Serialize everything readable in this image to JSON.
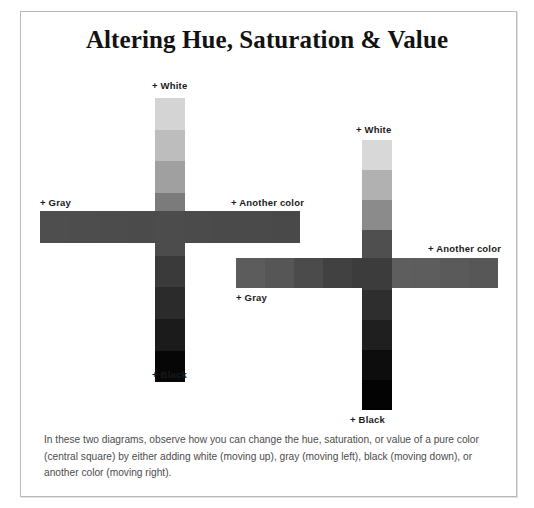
{
  "page": {
    "title": "Altering Hue, Saturation & Value",
    "background_color": "#ffffff",
    "border_color": "#b9b9b9",
    "caption": "In these two diagrams, observe how you can change the hue, saturation, or value of a pure color (central square) by either adding white (moving up), gray (moving left), black (moving down), or another color (moving right)."
  },
  "labels": {
    "white": "+ White",
    "gray": "+ Gray",
    "another_color": "+ Another color",
    "black": "+ Black"
  },
  "chart_data": {
    "type": "heatmap",
    "title": "Altering Hue, Saturation & Value",
    "axis_meanings": {
      "up": "+ White",
      "down": "+ Black",
      "left": "+ Gray",
      "right": "+ Another color"
    },
    "diagrams": [
      {
        "name": "diagram-1",
        "center_color": "#4c4c4c",
        "vertical": {
          "label_top": "+ White",
          "label_bottom": "+ Black",
          "steps_up": [
            "#d4d4d4",
            "#bdbdbd",
            "#a0a0a0",
            "#7b7b7b"
          ],
          "steps_down": [
            "#3a3a3a",
            "#2b2b2b",
            "#1b1b1b",
            "#060606"
          ]
        },
        "horizontal": {
          "label_left": "+ Gray",
          "label_right": "+ Another color",
          "steps_left": [
            "#4e4e4e",
            "#4d4d4d",
            "#4c4c4c",
            "#4b4b4b"
          ],
          "steps_right": [
            "#4b4b4b",
            "#4a4a4a",
            "#4a4a4a",
            "#494949"
          ]
        }
      },
      {
        "name": "diagram-2",
        "center_color": "#3c3c3c",
        "vertical": {
          "label_top": "+ White",
          "label_bottom": "+ Black",
          "steps_up": [
            "#d8d8d8",
            "#b1b1b1",
            "#8b8b8b",
            "#4f4f4f"
          ],
          "steps_down": [
            "#2e2e2e",
            "#1f1f1f",
            "#0d0d0d",
            "#030303"
          ]
        },
        "horizontal": {
          "label_left": "+ Gray",
          "label_right": "+ Another color",
          "steps_left": [
            "#5c5c5c",
            "#565656",
            "#4b4b4b",
            "#414141"
          ],
          "steps_right": [
            "#5e5e5e",
            "#5d5d5d",
            "#5a5a5a",
            "#575757"
          ]
        }
      }
    ]
  }
}
